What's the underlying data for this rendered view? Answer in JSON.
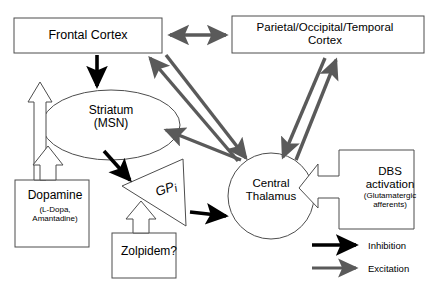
{
  "diagram": {
    "colors": {
      "inhibition": "#000000",
      "excitation": "#5a5a5a",
      "outline": "#555555",
      "hollow_fill": "#ffffff",
      "background": "#ffffff"
    },
    "nodes": [
      {
        "id": "frontal-cortex",
        "shape": "rectangle",
        "label": "Frontal Cortex"
      },
      {
        "id": "parietal-occipital-temporal-cortex",
        "shape": "rectangle",
        "label": "Parietal/Occipital/Temporal\nCortex"
      },
      {
        "id": "striatum",
        "shape": "ellipse",
        "label": "Striatum\n(MSN)"
      },
      {
        "id": "central-thalamus",
        "shape": "circle",
        "label": "Central\nThalamus"
      },
      {
        "id": "gpi",
        "shape": "triangle",
        "label": "GPi",
        "label_main": "GP",
        "label_sub": "i"
      },
      {
        "id": "dopamine",
        "shape": "rectangle",
        "label": "Dopamine",
        "sublabel": "(L-Dopa,\nAmantadine)"
      },
      {
        "id": "zolpidem",
        "shape": "rectangle",
        "label": "Zolpidem?"
      },
      {
        "id": "dbs-activation",
        "shape": "block-arrow",
        "label": "DBS\nactivation",
        "sublabel": "(Glutamatergic\nafferents)"
      }
    ],
    "edges": [
      {
        "from": "frontal-cortex",
        "to": "parietal-occipital-temporal-cortex",
        "type": "excitation",
        "bidirectional": true
      },
      {
        "from": "frontal-cortex",
        "to": "striatum",
        "type": "inhibition",
        "bidirectional": false
      },
      {
        "from": "central-thalamus",
        "to": "frontal-cortex",
        "type": "excitation",
        "bidirectional": false
      },
      {
        "from": "frontal-cortex",
        "to": "central-thalamus",
        "type": "excitation",
        "bidirectional": false
      },
      {
        "from": "central-thalamus",
        "to": "striatum",
        "type": "excitation",
        "bidirectional": false
      },
      {
        "from": "central-thalamus",
        "to": "parietal-occipital-temporal-cortex",
        "type": "excitation",
        "bidirectional": false
      },
      {
        "from": "parietal-occipital-temporal-cortex",
        "to": "central-thalamus",
        "type": "excitation",
        "bidirectional": false
      },
      {
        "from": "striatum",
        "to": "gpi",
        "type": "inhibition",
        "bidirectional": false
      },
      {
        "from": "gpi",
        "to": "central-thalamus",
        "type": "inhibition",
        "bidirectional": false
      },
      {
        "from": "dopamine",
        "to": "frontal-cortex",
        "type": "modulation-hollow",
        "bidirectional": false
      },
      {
        "from": "dopamine",
        "to": "striatum",
        "type": "modulation-hollow",
        "bidirectional": false
      },
      {
        "from": "zolpidem",
        "to": "gpi",
        "type": "modulation-hollow",
        "bidirectional": false
      },
      {
        "from": "dbs-activation",
        "to": "central-thalamus",
        "type": "modulation-hollow",
        "bidirectional": false
      }
    ]
  },
  "legend": {
    "items": [
      {
        "id": "inhibition",
        "label": "Inhibition",
        "color": "#000000"
      },
      {
        "id": "excitation",
        "label": "Excitation",
        "color": "#5a5a5a"
      }
    ]
  }
}
